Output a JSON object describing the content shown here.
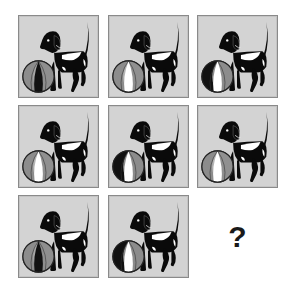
{
  "puzzle": {
    "type": "3x3 visual pattern grid",
    "missing_label": "?",
    "colors": {
      "panel_bg": "#d3d3d3",
      "panel_border": "#8a8a8a",
      "dog": "#0a0a0a",
      "dog_patch": "#ffffff",
      "ball_gray": "#8c8c8c",
      "ball_light": "#b5b5b5",
      "ball_dark": "#111111"
    },
    "cells": [
      {
        "row": 1,
        "col": 1,
        "ball": "gray-sides-black-center"
      },
      {
        "row": 1,
        "col": 2,
        "ball": "light-sides-white-center"
      },
      {
        "row": 1,
        "col": 3,
        "ball": "dark-sides-white-center"
      },
      {
        "row": 2,
        "col": 1,
        "ball": "light-sides-white-center"
      },
      {
        "row": 2,
        "col": 2,
        "ball": "dark-sides-white-center"
      },
      {
        "row": 2,
        "col": 3,
        "ball": "light-sides-white-center"
      },
      {
        "row": 3,
        "col": 1,
        "ball": "gray-sides-black-center"
      },
      {
        "row": 3,
        "col": 2,
        "ball": "dark-sides-white-center"
      },
      {
        "row": 3,
        "col": 3,
        "ball": "missing"
      }
    ]
  }
}
